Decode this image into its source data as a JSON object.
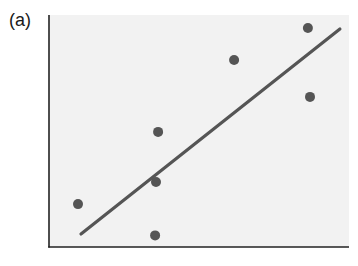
{
  "panel": {
    "label": "(a)"
  },
  "chart_data": {
    "type": "scatter",
    "title": "",
    "xlabel": "",
    "ylabel": "",
    "xlim": [
      0,
      10
    ],
    "ylim": [
      0,
      10
    ],
    "grid": false,
    "legend": null,
    "ticks": false,
    "series": [
      {
        "name": "points",
        "kind": "scatter",
        "x": [
          0.97,
          3.55,
          3.58,
          3.65,
          6.19,
          8.66,
          8.73
        ],
        "y": [
          1.85,
          0.5,
          2.8,
          4.96,
          8.06,
          9.44,
          6.47
        ]
      },
      {
        "name": "fit line",
        "kind": "line",
        "x": [
          1.07,
          9.73
        ],
        "y": [
          0.56,
          9.4
        ]
      }
    ],
    "colors": {
      "points": "#555555",
      "line": "#555555",
      "axes": "#222222",
      "plot_background": "#f2f2f2"
    }
  }
}
